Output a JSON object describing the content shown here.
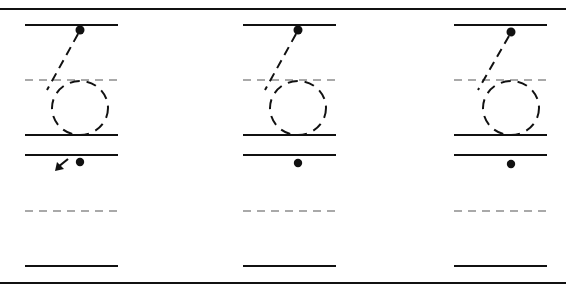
{
  "worksheet": {
    "title": "Number 6 tracing practice",
    "digit": "6",
    "ink_color": "#111111",
    "guide_color": "#555555",
    "border": {
      "top_y": 9,
      "bottom_y": 283
    },
    "rows": [
      {
        "name": "tracing-row",
        "top_line_y": 25,
        "mid_dashed_y": 80,
        "base_line_y": 135
      },
      {
        "name": "practice-row",
        "top_line_y": 155,
        "mid_dashed_y": 211,
        "base_line_y": 266
      }
    ],
    "columns": [
      {
        "x1": 25,
        "x2": 118,
        "start_dot": [
          80,
          30
        ],
        "practice_dot": [
          80,
          162
        ],
        "show_arrow": true
      },
      {
        "x1": 243,
        "x2": 336,
        "start_dot": [
          298,
          30
        ],
        "practice_dot": [
          298,
          163
        ],
        "show_arrow": false
      },
      {
        "x1": 454,
        "x2": 547,
        "start_dot": [
          511,
          32
        ],
        "practice_dot": [
          511,
          164
        ],
        "show_arrow": false
      }
    ],
    "arrow_hint": "start-direction-arrow"
  }
}
